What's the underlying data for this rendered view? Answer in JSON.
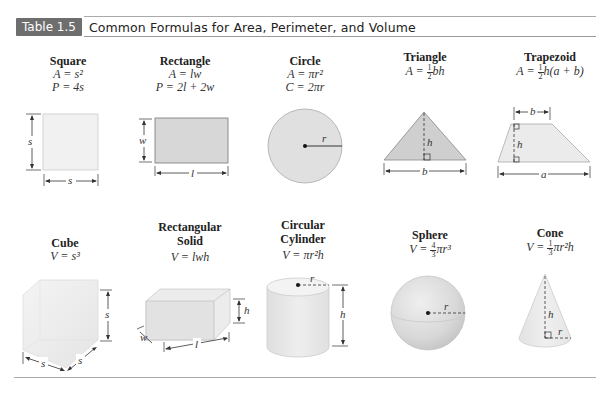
{
  "header": {
    "badge": "Table 1.5",
    "title": "Common Formulas for Area, Perimeter, and Volume"
  },
  "shapes_2d": [
    {
      "name": "Square",
      "formulas": [
        "A = s²",
        "P = 4s"
      ],
      "labels": {
        "side_v": "s",
        "side_h": "s"
      }
    },
    {
      "name": "Rectangle",
      "formulas": [
        "A = lw",
        "P = 2l + 2w"
      ],
      "labels": {
        "width": "w",
        "length": "l"
      }
    },
    {
      "name": "Circle",
      "formulas": [
        "A = πr²",
        "C = 2πr"
      ],
      "labels": {
        "radius": "r"
      }
    },
    {
      "name": "Triangle",
      "formula_prefix": "A = ",
      "formula_frac": {
        "num": "1",
        "den": "2"
      },
      "formula_suffix": "bh",
      "labels": {
        "height": "h",
        "base": "b"
      }
    },
    {
      "name": "Trapezoid",
      "formula_prefix": "A = ",
      "formula_frac": {
        "num": "1",
        "den": "2"
      },
      "formula_suffix": "h(a + b)",
      "labels": {
        "top": "b",
        "height": "h",
        "bottom": "a"
      }
    }
  ],
  "shapes_3d": [
    {
      "name": "Cube",
      "formulas": [
        "V = s³"
      ],
      "labels": {
        "height": "s",
        "width": "s",
        "depth": "s"
      }
    },
    {
      "name_lines": [
        "Rectangular",
        "Solid"
      ],
      "formulas": [
        "V = lwh"
      ],
      "labels": {
        "height": "h",
        "width": "w",
        "length": "l"
      }
    },
    {
      "name_lines": [
        "Circular",
        "Cylinder"
      ],
      "formulas": [
        "V = πr²h"
      ],
      "labels": {
        "radius": "r",
        "height": "h"
      }
    },
    {
      "name": "Sphere",
      "formula_prefix": "V = ",
      "formula_frac": {
        "num": "4",
        "den": "3"
      },
      "formula_suffix": "πr³",
      "labels": {
        "radius": "r"
      }
    },
    {
      "name": "Cone",
      "formula_prefix": "V = ",
      "formula_frac": {
        "num": "1",
        "den": "3"
      },
      "formula_suffix": "πr²h",
      "labels": {
        "height": "h",
        "radius": "r"
      }
    }
  ]
}
